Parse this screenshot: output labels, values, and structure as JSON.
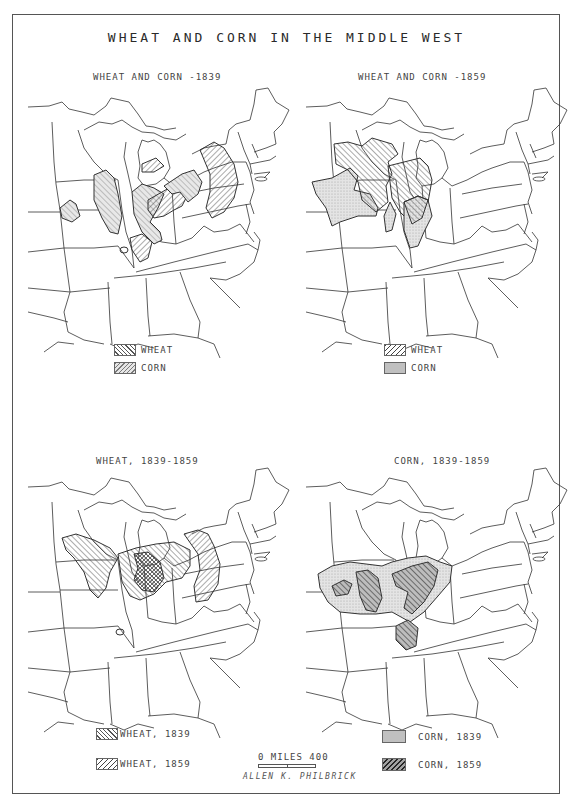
{
  "title": "WHEAT AND CORN IN THE MIDDLE WEST",
  "panels": [
    {
      "id": "top-left",
      "title": "WHEAT AND CORN -1839",
      "legend": [
        {
          "label": "WHEAT",
          "pattern": "hatch-right"
        },
        {
          "label": "CORN",
          "pattern": "hatch-left-light"
        }
      ]
    },
    {
      "id": "top-right",
      "title": "WHEAT AND CORN -1859",
      "legend": [
        {
          "label": "WHEAT",
          "pattern": "hatch-left"
        },
        {
          "label": "CORN",
          "pattern": "stipple"
        }
      ]
    },
    {
      "id": "bottom-left",
      "title": "WHEAT, 1839-1859",
      "legend": [
        {
          "label": "WHEAT, 1839",
          "pattern": "hatch-right"
        },
        {
          "label": "WHEAT, 1859",
          "pattern": "hatch-left"
        }
      ]
    },
    {
      "id": "bottom-right",
      "title": "CORN, 1839-1859",
      "legend": [
        {
          "label": "CORN, 1839",
          "pattern": "stipple"
        },
        {
          "label": "CORN, 1859",
          "pattern": "hatch-left-dark"
        }
      ]
    }
  ],
  "scale": {
    "label": "0   MILES 400"
  },
  "author": "ALLEN K. PHILBRICK",
  "colors": {
    "ink": "#333333",
    "background": "#ffffff",
    "stipple": "#e2e2e2"
  }
}
